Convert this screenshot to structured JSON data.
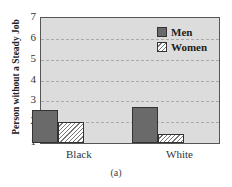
{
  "chart_data": {
    "type": "bar",
    "title": "",
    "caption": "(a)",
    "xlabel": "",
    "ylabel": "Person without a Steady Job",
    "ylim": [
      1,
      7
    ],
    "yticks": [
      1,
      2,
      3,
      4,
      5,
      6,
      7
    ],
    "categories": [
      "Black",
      "White"
    ],
    "series": [
      {
        "name": "Men",
        "values": [
          2.6,
          2.75
        ],
        "color": "#6a6a6a",
        "pattern": "solid"
      },
      {
        "name": "Women",
        "values": [
          2.0,
          1.45
        ],
        "color": "#ffffff",
        "pattern": "hatched"
      }
    ],
    "grid": true,
    "legend_position": "upper right"
  }
}
